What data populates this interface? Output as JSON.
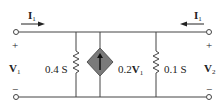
{
  "diagram": {
    "type": "two-port circuit",
    "colors": {
      "wire": "#444444",
      "source_fill": "#7a7a7a",
      "text": "#222222"
    },
    "left_port": {
      "current": {
        "symbol": "I",
        "subscript": "1",
        "direction": "right"
      },
      "voltage": {
        "symbol": "V",
        "subscript": "1"
      },
      "plus": "+",
      "minus": "−"
    },
    "right_port": {
      "current": {
        "symbol": "I",
        "subscript": "1",
        "direction": "left"
      },
      "voltage": {
        "symbol": "V",
        "subscript": "2"
      },
      "plus": "+",
      "minus": "−"
    },
    "components": [
      {
        "id": "R1",
        "kind": "resistor",
        "label": "0.4 S"
      },
      {
        "id": "G1",
        "kind": "dependent-current-source",
        "arrow": "up",
        "label_prefix": "0.2",
        "label_symbol": "V",
        "label_subscript": "1"
      },
      {
        "id": "R2",
        "kind": "resistor",
        "label": "0.1 S"
      }
    ]
  }
}
